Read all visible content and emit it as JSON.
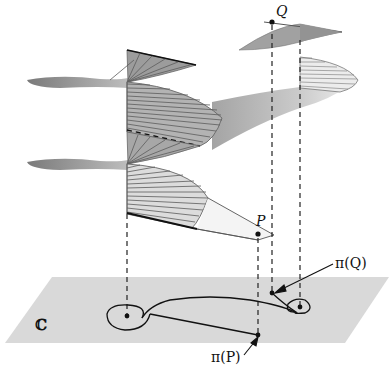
{
  "diagram": {
    "type": "riemann-surface-covering",
    "labels": {
      "point_q": "Q",
      "point_p": "P",
      "proj_q": "π(Q)",
      "proj_p": "π(P)",
      "plane": "ℂ"
    },
    "colors": {
      "plane": "#d9d9d9",
      "sheet_dark": "#8f8f8f",
      "sheet_mid": "#a8a8a8",
      "sheet_light": "#d2d2d2",
      "ruling": "#5c5c5c",
      "ink": "#111111"
    },
    "elements": [
      "helicoid-sheet-left (branch point at left dot)",
      "helicoid-sheet-right (branch point at right dot)",
      "connecting ribbon between sheets",
      "strip leading to P",
      "complex plane ℂ with path: loop around left branch point, loop around right branch point",
      "dashed vertical projection lines"
    ]
  }
}
